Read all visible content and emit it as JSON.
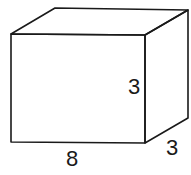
{
  "figure": {
    "type": "rectangular-prism",
    "labels": {
      "length": "8",
      "height": "3",
      "depth": "3"
    },
    "stroke_color": "#1a1a1a",
    "background": "#ffffff"
  }
}
